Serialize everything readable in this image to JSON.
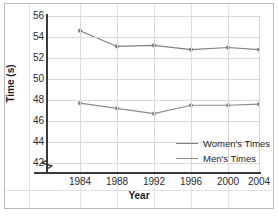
{
  "chart_data": {
    "type": "line",
    "title": "",
    "xlabel": "Year",
    "ylabel": "Time (s)",
    "categories": [
      "1984",
      "1988",
      "1992",
      "1996",
      "2000",
      "2004"
    ],
    "x": [
      1984,
      1988,
      1992,
      1996,
      2000,
      2004
    ],
    "series": [
      {
        "name": "Women's Times",
        "color": "#808080",
        "values": [
          54.6,
          53.1,
          53.2,
          52.8,
          53.0,
          52.8
        ]
      },
      {
        "name": "Men's Times",
        "color": "#8c8c8c",
        "values": [
          47.7,
          47.2,
          46.7,
          47.5,
          47.5,
          47.6
        ]
      }
    ],
    "ylim": [
      41,
      57
    ],
    "y_ticks": [
      42,
      44,
      46,
      48,
      50,
      52,
      54,
      56
    ],
    "y_tick_labels": [
      "42",
      "44",
      "46",
      "48",
      "50",
      "52",
      "54",
      "56"
    ],
    "xlim": [
      1982,
      2006
    ],
    "grid": true,
    "y_axis_break": true,
    "legend_position": "inside-bottom-right",
    "marker": "circle"
  },
  "axes": {
    "y_title": "Time (s)",
    "x_title": "Year"
  },
  "legend": {
    "items": [
      {
        "label": "Women's Times"
      },
      {
        "label": "Men's Times"
      }
    ]
  },
  "colors": {
    "series_women": "#808080",
    "series_men": "#8c8c8c",
    "axis": "#3a3a3a",
    "grid": "#d8d8d8",
    "background_grid": "#e2e2e2",
    "text": "#2b2b2b",
    "border": "#b9b9b9"
  }
}
